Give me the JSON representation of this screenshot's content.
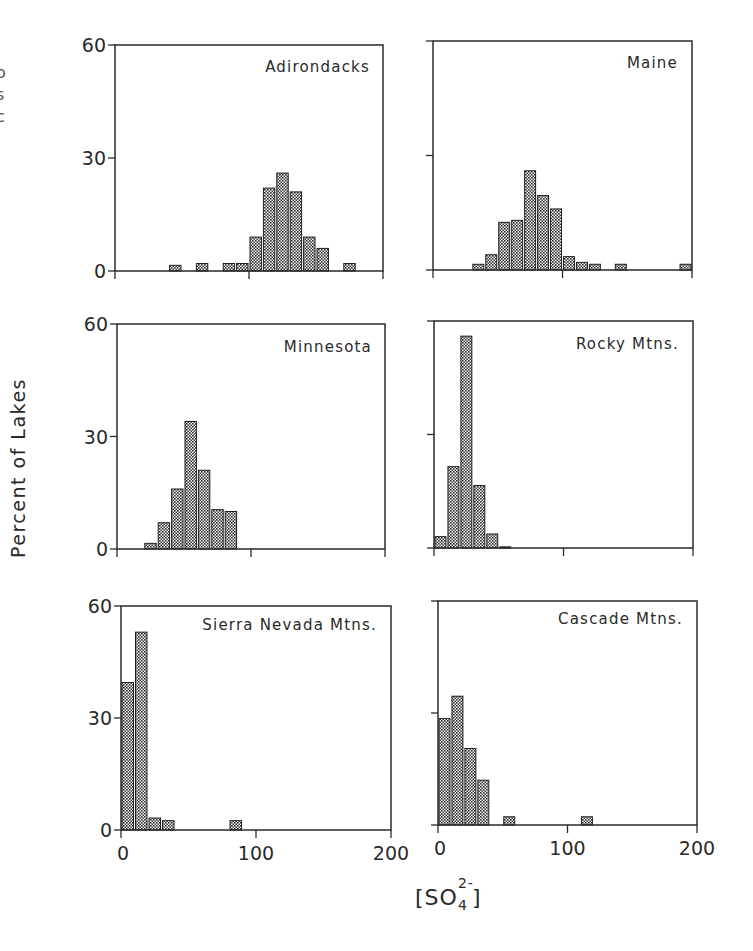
{
  "figure": {
    "y_axis_label": "Percent of Lakes",
    "x_axis_label_prefix": "[SO",
    "x_axis_label_sub": "4",
    "x_axis_label_sup": "2-",
    "x_axis_label_suffix": "]",
    "edge_crop_glyphs": [
      "I",
      "o",
      "s",
      "c"
    ]
  },
  "chart_data": [
    {
      "type": "bar",
      "title": "Adirondacks",
      "xlabel": "[SO4 2-]",
      "ylabel": "Percent of Lakes",
      "xlim": [
        0,
        200
      ],
      "ylim": [
        0,
        60
      ],
      "xticks": [
        0,
        100,
        200
      ],
      "yticks": [
        0,
        30,
        60
      ],
      "bin_width": 10,
      "bins": [
        40,
        60,
        80,
        90,
        100,
        110,
        120,
        130,
        140,
        150,
        170
      ],
      "values": [
        1.5,
        2,
        2,
        2,
        9,
        22,
        26,
        21,
        9,
        6,
        2
      ]
    },
    {
      "type": "bar",
      "title": "Maine",
      "xlabel": "[SO4 2-]",
      "ylabel": "Percent of Lakes",
      "xlim": [
        0,
        200
      ],
      "ylim": [
        0,
        60
      ],
      "xticks": [
        0,
        100,
        200
      ],
      "yticks": [
        0,
        30,
        60
      ],
      "bin_width": 10,
      "bins": [
        30,
        40,
        50,
        60,
        70,
        80,
        90,
        100,
        110,
        120,
        140,
        190
      ],
      "values": [
        1.5,
        4,
        12.5,
        13,
        26,
        19.5,
        16,
        3.5,
        2,
        1.5,
        1.5,
        1.5
      ]
    },
    {
      "type": "bar",
      "title": "Minnesota",
      "xlabel": "[SO4 2-]",
      "ylabel": "Percent of Lakes",
      "xlim": [
        0,
        200
      ],
      "ylim": [
        0,
        60
      ],
      "xticks": [
        0,
        100,
        200
      ],
      "yticks": [
        0,
        30,
        60
      ],
      "bin_width": 10,
      "bins": [
        20,
        30,
        40,
        50,
        60,
        70,
        80
      ],
      "values": [
        1.5,
        7,
        16,
        34,
        21,
        10.5,
        10
      ]
    },
    {
      "type": "bar",
      "title": "Rocky Mtns.",
      "xlabel": "[SO4 2-]",
      "ylabel": "Percent of Lakes",
      "xlim": [
        0,
        200
      ],
      "ylim": [
        0,
        60
      ],
      "xticks": [
        0,
        100,
        200
      ],
      "yticks": [
        0,
        30,
        60
      ],
      "bin_width": 10,
      "bins": [
        0,
        10,
        20,
        30,
        40,
        50
      ],
      "values": [
        3,
        21.5,
        56,
        16.5,
        3.7,
        0.3
      ]
    },
    {
      "type": "bar",
      "title": "Sierra Nevada Mtns.",
      "xlabel": "[SO4 2-]",
      "ylabel": "Percent of Lakes",
      "xlim": [
        0,
        200
      ],
      "ylim": [
        0,
        60
      ],
      "xticks": [
        0,
        100,
        200
      ],
      "yticks": [
        0,
        30,
        60
      ],
      "bin_width": 10,
      "bins": [
        0,
        10,
        20,
        30,
        80
      ],
      "values": [
        39.5,
        53,
        3.2,
        2.5,
        2.5
      ]
    },
    {
      "type": "bar",
      "title": "Cascade Mtns.",
      "xlabel": "[SO4 2-]",
      "ylabel": "Percent of Lakes",
      "xlim": [
        0,
        200
      ],
      "ylim": [
        0,
        60
      ],
      "xticks": [
        0,
        100,
        200
      ],
      "yticks": [
        0,
        30,
        60
      ],
      "bin_width": 10,
      "bins": [
        0,
        10,
        20,
        30,
        50,
        110
      ],
      "values": [
        28.5,
        34.5,
        20.5,
        12,
        2.2,
        2.2
      ]
    }
  ],
  "layout": {
    "panels": [
      {
        "x0": 115,
        "x1": 383,
        "y0": 271,
        "y1": 45,
        "show_y_ticklabels": true,
        "show_x_ticklabels": false,
        "title_x": 370,
        "title_y": 72
      },
      {
        "x0": 433,
        "x1": 692,
        "y0": 270,
        "y1": 41,
        "show_y_ticklabels": false,
        "show_x_ticklabels": false,
        "title_x": 678,
        "title_y": 68
      },
      {
        "x0": 117,
        "x1": 385,
        "y0": 549,
        "y1": 324,
        "show_y_ticklabels": true,
        "show_x_ticklabels": false,
        "title_x": 372,
        "title_y": 352
      },
      {
        "x0": 434,
        "x1": 693,
        "y0": 548,
        "y1": 321,
        "show_y_ticklabels": false,
        "show_x_ticklabels": false,
        "title_x": 679,
        "title_y": 349
      },
      {
        "x0": 121,
        "x1": 391,
        "y0": 830,
        "y1": 606,
        "show_y_ticklabels": true,
        "show_x_ticklabels": true,
        "title_x": 377,
        "title_y": 630
      },
      {
        "x0": 438,
        "x1": 697,
        "y0": 825,
        "y1": 601,
        "show_y_ticklabels": false,
        "show_x_ticklabels": true,
        "title_x": 683,
        "title_y": 624
      }
    ],
    "ink_color": "#2a2a2a",
    "bar_fill": "#7a7a7a",
    "bar_stroke": "#1e1e1e"
  }
}
